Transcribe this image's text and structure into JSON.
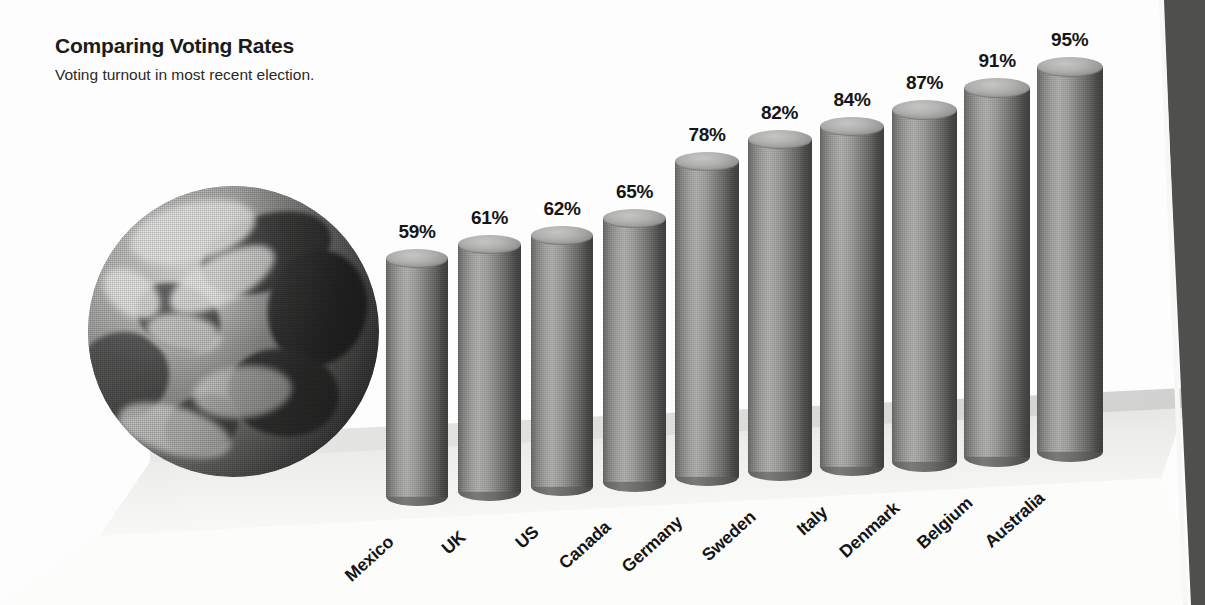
{
  "header": {
    "title": "Comparing Voting Rates",
    "subtitle": "Voting turnout in most recent election."
  },
  "decor": {
    "globe_name": "earth-globe-photo",
    "ground_name": "perspective-ground-plane",
    "page_edge_name": "page-edge-artifact"
  },
  "colors": {
    "background": "#fdfdfd",
    "bar_light": "#b7b7b5",
    "bar_mid": "#8a8a88",
    "bar_dark": "#434342",
    "bar_cap": "#b2b2b0",
    "text": "#161616",
    "ground_shade": "#e6e6e4",
    "page_edge": "#4f4f4e"
  },
  "chart_data": {
    "type": "bar",
    "title": "Comparing Voting Rates",
    "subtitle": "Voting turnout in most recent election.",
    "xlabel": "",
    "ylabel": "",
    "unit": "%",
    "ylim": [
      0,
      100
    ],
    "grid": false,
    "legend": null,
    "style": "3d-cylinder-perspective",
    "categories": [
      "Mexico",
      "UK",
      "US",
      "Canada",
      "Germany",
      "Sweden",
      "Italy",
      "Denmark",
      "Belgium",
      "Australia"
    ],
    "values": [
      59,
      61,
      62,
      65,
      78,
      82,
      84,
      87,
      91,
      95
    ],
    "value_labels": [
      "59%",
      "61%",
      "62%",
      "65%",
      "78%",
      "82%",
      "84%",
      "87%",
      "91%",
      "95%"
    ]
  }
}
